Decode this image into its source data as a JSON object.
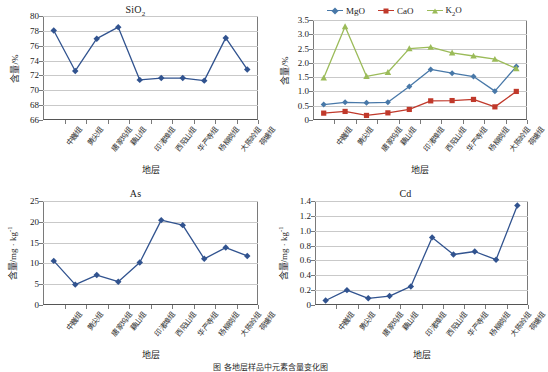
{
  "figure": {
    "caption": "图 各地层样品中元素含量变化图",
    "categories": [
      "中巍组",
      "黄尖组",
      "唐家坞组",
      "藕山组",
      "印渚埠组",
      "西阳山组",
      "华严寺组",
      "杨柳岗组",
      "大陈岭组",
      "荷塘组"
    ],
    "xlabel": "地层"
  },
  "colors": {
    "mgo": "#4878a8",
    "cao": "#c0392b",
    "k2o": "#9bbb59",
    "sio2": "#31538f",
    "as": "#31538f",
    "cd": "#31538f",
    "gridline": "#c9c9c9",
    "axis": "#7a7a7a"
  },
  "chart_data": [
    {
      "type": "line",
      "id": "sio2",
      "title": "SiO2",
      "title_main": "SiO",
      "title_sub": "2",
      "xlabel": "地层",
      "ylabel": "含量/%",
      "ylim": [
        66,
        80
      ],
      "yticks": [
        66,
        68,
        70,
        72,
        74,
        76,
        78,
        80
      ],
      "ytick_labels": [
        "66",
        "68",
        "70",
        "72",
        "74",
        "76",
        "78",
        "80"
      ],
      "grid": true,
      "legend": false,
      "categories": [
        "中巍组",
        "黄尖组",
        "唐家坞组",
        "藕山组",
        "印渚埠组",
        "西阳山组",
        "华严寺组",
        "杨柳岗组",
        "大陈岭组",
        "荷塘组"
      ],
      "values": [
        78.05,
        72.6,
        76.95,
        78.5,
        71.4,
        71.65,
        71.65,
        71.3,
        77.05,
        72.8
      ]
    },
    {
      "type": "line",
      "id": "oxides",
      "title": "",
      "xlabel": "地层",
      "ylabel": "含量/%",
      "ylim": [
        0,
        3.5
      ],
      "yticks": [
        0,
        0.5,
        1.0,
        1.5,
        2.0,
        2.5,
        3.0,
        3.5
      ],
      "ytick_labels": [
        "0",
        "0.5",
        "1.0",
        "1.5",
        "2.0",
        "2.5",
        "3.0",
        "3.5"
      ],
      "grid": true,
      "legend": true,
      "legend_position": "top-center",
      "categories": [
        "中巍组",
        "黄尖组",
        "唐家坞组",
        "藕山组",
        "印渚埠组",
        "西阳山组",
        "华严寺组",
        "杨柳岗组",
        "大陈岭组",
        "荷塘组"
      ],
      "series": [
        {
          "name": "MgO",
          "name_main": "MgO",
          "name_sub": "",
          "color": "#4878a8",
          "marker": "diamond",
          "values": [
            0.54,
            0.62,
            0.6,
            0.62,
            1.17,
            1.77,
            1.64,
            1.52,
            1.01,
            1.87
          ]
        },
        {
          "name": "CaO",
          "name_main": "CaO",
          "name_sub": "",
          "color": "#c0392b",
          "marker": "square",
          "values": [
            0.24,
            0.3,
            0.16,
            0.25,
            0.37,
            0.67,
            0.68,
            0.72,
            0.46,
            1.0
          ]
        },
        {
          "name": "K2O",
          "name_main": "K",
          "name_sub": "2",
          "name_tail": "O",
          "color": "#9bbb59",
          "marker": "triangle",
          "values": [
            1.47,
            3.27,
            1.53,
            1.67,
            2.5,
            2.55,
            2.35,
            2.24,
            2.13,
            1.8
          ]
        }
      ]
    },
    {
      "type": "line",
      "id": "as",
      "title": "As",
      "title_main": "As",
      "title_sub": "",
      "xlabel": "地层",
      "ylabel": "含量/mg·kg-1",
      "ylabel_main": "含量/mg",
      "ylabel_dot": "·",
      "ylabel_unit": "kg",
      "ylabel_exp": "-1",
      "ylim": [
        0,
        25
      ],
      "yticks": [
        0,
        5,
        10,
        15,
        20,
        25
      ],
      "ytick_labels": [
        "0",
        "5",
        "10",
        "15",
        "20",
        "25"
      ],
      "grid": true,
      "legend": false,
      "categories": [
        "中巍组",
        "黄尖组",
        "唐家坞组",
        "藕山组",
        "印渚埠组",
        "西阳山组",
        "华严寺组",
        "杨柳岗组",
        "大陈岭组",
        "荷塘组"
      ],
      "values": [
        10.6,
        4.9,
        7.2,
        5.6,
        10.2,
        20.4,
        19.2,
        11.1,
        13.8,
        11.8
      ]
    },
    {
      "type": "line",
      "id": "cd",
      "title": "Cd",
      "title_main": "Cd",
      "title_sub": "",
      "xlabel": "地层",
      "ylabel": "含量/mg·kg-1",
      "ylabel_main": "含量/mg",
      "ylabel_dot": "·",
      "ylabel_unit": "kg",
      "ylabel_exp": "-1",
      "ylim": [
        0,
        1.4
      ],
      "yticks": [
        0,
        0.2,
        0.4,
        0.6,
        0.8,
        1.0,
        1.2,
        1.4
      ],
      "ytick_labels": [
        "0",
        "0.2",
        "0.4",
        "0.6",
        "0.8",
        "1.0",
        "1.2",
        "1.4"
      ],
      "grid": true,
      "legend": false,
      "categories": [
        "中巍组",
        "黄尖组",
        "唐家坞组",
        "藕山组",
        "印渚埠组",
        "西阳山组",
        "华严寺组",
        "杨柳岗组",
        "大陈岭组",
        "荷塘组"
      ],
      "values": [
        0.06,
        0.2,
        0.09,
        0.12,
        0.25,
        0.91,
        0.68,
        0.72,
        0.61,
        1.34
      ]
    }
  ]
}
